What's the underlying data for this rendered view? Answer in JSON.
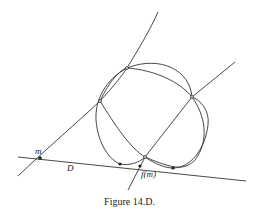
{
  "figure": {
    "caption": "Figure 14.D.",
    "labels": {
      "point_m": "m",
      "line_D": "D",
      "point_fm": "f(m)"
    },
    "colors": {
      "stroke": "#333333",
      "background": "#ffffff"
    },
    "elements": {
      "line_D": {
        "from": [
          18,
          158
        ],
        "to": [
          246,
          180
        ]
      },
      "line_through_m": {
        "from": [
          18,
          175
        ],
        "to": [
          158,
          12
        ]
      },
      "line_through_fm": {
        "from": [
          128,
          190
        ],
        "to": [
          235,
          62
        ]
      },
      "curves": [
        "upper-loop",
        "lower-loop",
        "left-conic",
        "right-conic"
      ],
      "points": {
        "m": [
          40,
          158
        ],
        "f_m": [
          140,
          167
        ],
        "tangent_left": [
          120,
          164
        ],
        "tangent_right": [
          173,
          168
        ],
        "intersection_top": [
          127,
          68
        ],
        "intersection_left": [
          100,
          101
        ],
        "intersection_right": [
          192,
          97
        ],
        "intersection_bottom": [
          145,
          157
        ]
      }
    }
  }
}
